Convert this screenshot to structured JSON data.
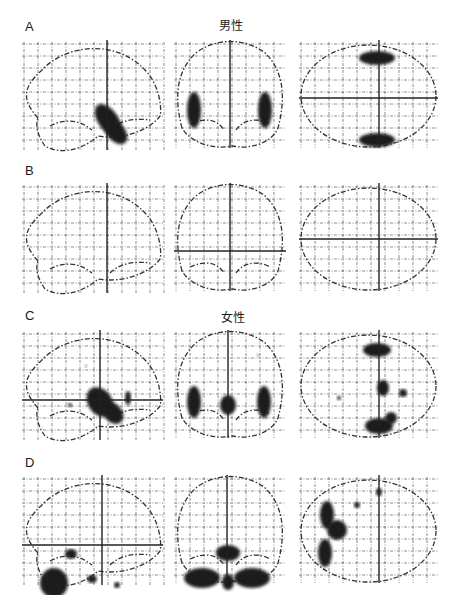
{
  "figure": {
    "rows": [
      {
        "label": "A",
        "group_title": "男性"
      },
      {
        "label": "B",
        "group_title": ""
      },
      {
        "label": "C",
        "group_title": "女性"
      },
      {
        "label": "D",
        "group_title": ""
      }
    ],
    "views": [
      "sagittal",
      "coronal",
      "axial"
    ],
    "colors": {
      "background": "#ffffff",
      "outline": "#333333",
      "grid": "#555555",
      "blob": "#1e1e1e"
    },
    "crosshairs": [
      {
        "sag": {
          "x": 87,
          "y": null
        },
        "cor": {
          "x": 58,
          "y": null
        },
        "ax": {
          "x": 82,
          "y": 58
        }
      },
      {
        "sag": {
          "x": 87,
          "y": null
        },
        "cor": {
          "x": 58,
          "y": 68
        },
        "ax": {
          "x": 82,
          "y": 56
        }
      },
      {
        "sag": {
          "x": 80,
          "y": 70
        },
        "cor": {
          "x": 56,
          "y": null
        },
        "ax": {
          "x": 82,
          "y": null
        }
      },
      {
        "sag": {
          "x": 82,
          "y": 70
        },
        "cor": {
          "x": 55,
          "y": null
        },
        "ax": {
          "x": 82,
          "y": null
        }
      }
    ],
    "blobs": [
      {
        "sag": [
          [
            88,
            80,
            10,
            18,
            -35
          ],
          [
            96,
            92,
            9,
            14,
            -40
          ]
        ],
        "cor": [
          [
            22,
            70,
            7,
            18,
            0
          ],
          [
            93,
            70,
            7,
            18,
            0
          ]
        ],
        "ax": [
          [
            80,
            18,
            18,
            7,
            0
          ],
          [
            80,
            100,
            18,
            7,
            0
          ]
        ]
      },
      {
        "sag": [],
        "cor": [],
        "ax": []
      },
      {
        "sag": [
          [
            80,
            72,
            12,
            16,
            -35
          ],
          [
            93,
            83,
            9,
            12,
            -40
          ],
          [
            108,
            68,
            3,
            7,
            0
          ],
          [
            50,
            75,
            2,
            2,
            0
          ],
          [
            66,
            36,
            1,
            1,
            0
          ]
        ],
        "cor": [
          [
            22,
            72,
            7,
            16,
            0
          ],
          [
            92,
            72,
            7,
            16,
            0
          ],
          [
            56,
            75,
            8,
            10,
            0
          ],
          [
            86,
            25,
            1,
            1,
            0
          ]
        ],
        "ax": [
          [
            80,
            20,
            14,
            7,
            0
          ],
          [
            86,
            58,
            6,
            8,
            0
          ],
          [
            106,
            63,
            4,
            4,
            0
          ],
          [
            82,
            96,
            14,
            8,
            0
          ],
          [
            94,
            88,
            6,
            6,
            0
          ],
          [
            42,
            68,
            2,
            2,
            0
          ]
        ]
      },
      {
        "sag": [
          [
            34,
            108,
            14,
            15,
            0
          ],
          [
            51,
            79,
            6,
            5,
            0
          ],
          [
            72,
            104,
            5,
            4,
            0
          ],
          [
            97,
            110,
            3,
            3,
            0
          ]
        ],
        "cor": [
          [
            56,
            78,
            12,
            8,
            0
          ],
          [
            30,
            103,
            18,
            10,
            0
          ],
          [
            80,
            103,
            18,
            10,
            0
          ],
          [
            56,
            107,
            6,
            8,
            0
          ]
        ],
        "ax": [
          [
            30,
            40,
            7,
            14,
            0
          ],
          [
            40,
            55,
            10,
            10,
            0
          ],
          [
            28,
            78,
            7,
            14,
            0
          ],
          [
            60,
            30,
            3,
            3,
            0
          ],
          [
            82,
            17,
            3,
            4,
            0
          ]
        ]
      }
    ]
  }
}
